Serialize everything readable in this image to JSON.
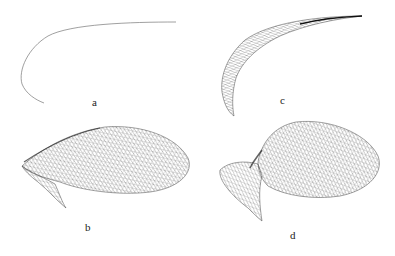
{
  "figure": {
    "panels": [
      {
        "id": "a",
        "label": "a",
        "kind": "curve"
      },
      {
        "id": "b",
        "label": "b",
        "kind": "wireframe-surface"
      },
      {
        "id": "c",
        "label": "c",
        "kind": "wireframe-band"
      },
      {
        "id": "d",
        "label": "d",
        "kind": "wireframe-surface"
      }
    ],
    "colors": {
      "line": "#333333",
      "mesh": "#555555",
      "background": "#ffffff"
    }
  }
}
